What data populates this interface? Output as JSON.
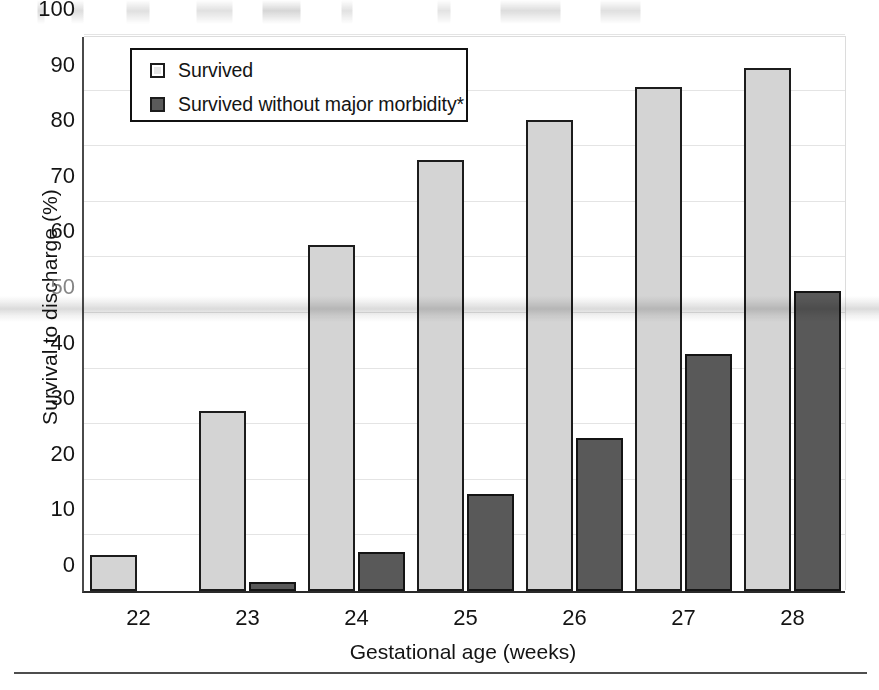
{
  "chart_data": {
    "type": "bar",
    "title": "",
    "xlabel": "Gestational age (weeks)",
    "ylabel": "Survival to discharge (%)",
    "categories": [
      "22",
      "23",
      "24",
      "25",
      "26",
      "27",
      "28"
    ],
    "ylim": [
      0,
      100
    ],
    "yticks": [
      "0",
      "10",
      "20",
      "30",
      "40",
      "50",
      "60",
      "70",
      "80",
      "90",
      "100"
    ],
    "grid": true,
    "legend_position": "top-left",
    "series": [
      {
        "name": "Survived",
        "color": "#d4d4d4",
        "values": [
          6.5,
          32.4,
          62.3,
          77.5,
          84.8,
          90.7,
          94.0
        ]
      },
      {
        "name": "Survived without major morbidity*",
        "color": "#595959",
        "values": [
          0,
          1.6,
          7.1,
          17.4,
          27.6,
          42.6,
          54.0
        ]
      }
    ]
  },
  "legend": {
    "items": [
      {
        "label": "Survived",
        "swatch": "light"
      },
      {
        "label": "Survived without major morbidity*",
        "swatch": "dark"
      }
    ]
  },
  "colors": {
    "series_light": "#d4d4d4",
    "series_dark": "#595959",
    "axis": "#1c1c1c",
    "grid": "#e4e4e4",
    "text": "#141414"
  }
}
